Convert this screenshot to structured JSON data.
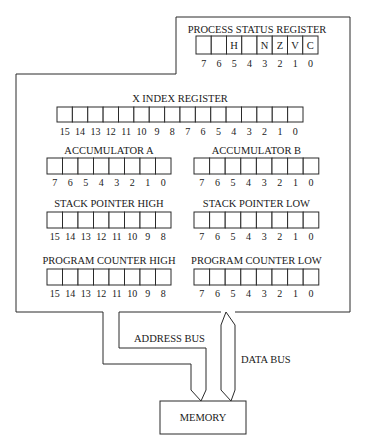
{
  "diagram": {
    "colors": {
      "line": "#2a2a2a",
      "text": "#1a1a1a",
      "background": "#ffffff"
    },
    "registers": [
      {
        "id": "psr",
        "label": "PROCESS STATUS REGISTER",
        "x": 196,
        "y": 36,
        "w": 15.25,
        "h": 18,
        "labelY": 33,
        "numY": 67,
        "bits": [
          "7",
          "6",
          "5",
          "4",
          "3",
          "2",
          "1",
          "0"
        ],
        "cells": [
          "",
          "",
          "H",
          "",
          "N",
          "Z",
          "V",
          "C"
        ]
      },
      {
        "id": "x-index",
        "label": "X INDEX REGISTER",
        "x": 57,
        "y": 107,
        "w": 15.375,
        "h": 15,
        "labelY": 102,
        "numY": 135,
        "bits": [
          "15",
          "14",
          "13",
          "12",
          "11",
          "10",
          "9",
          "8",
          "7",
          "6",
          "5",
          "4",
          "3",
          "2",
          "1",
          "0"
        ]
      },
      {
        "id": "acc-a",
        "label": "ACCUMULATOR A",
        "x": 47,
        "y": 158,
        "w": 15.5,
        "h": 16,
        "labelY": 154,
        "numY": 186,
        "bits": [
          "7",
          "6",
          "5",
          "4",
          "3",
          "2",
          "1",
          "0"
        ]
      },
      {
        "id": "acc-b",
        "label": "ACCUMULATOR B",
        "x": 194,
        "y": 158,
        "w": 15.6,
        "h": 16,
        "labelY": 154,
        "numY": 186,
        "bits": [
          "7",
          "6",
          "5",
          "4",
          "3",
          "2",
          "1",
          "0"
        ]
      },
      {
        "id": "sp-high",
        "label": "STACK POINTER HIGH",
        "x": 47,
        "y": 212,
        "w": 15.5,
        "h": 16,
        "labelY": 207,
        "numY": 240,
        "bits": [
          "15",
          "14",
          "13",
          "12",
          "11",
          "10",
          "9",
          "8"
        ]
      },
      {
        "id": "sp-low",
        "label": "STACK POINTER LOW",
        "x": 194,
        "y": 212,
        "w": 15.6,
        "h": 16,
        "labelY": 207,
        "numY": 240,
        "bits": [
          "7",
          "6",
          "5",
          "4",
          "3",
          "2",
          "1",
          "0"
        ]
      },
      {
        "id": "pc-high",
        "label": "PROGRAM COUNTER HIGH",
        "x": 47,
        "y": 269,
        "w": 15.5,
        "h": 16,
        "labelY": 264,
        "numY": 297,
        "bits": [
          "15",
          "14",
          "13",
          "12",
          "11",
          "10",
          "9",
          "8"
        ]
      },
      {
        "id": "pc-low",
        "label": "PROGRAM COUNTER LOW",
        "x": 194,
        "y": 269,
        "w": 15.6,
        "h": 16,
        "labelY": 264,
        "numY": 297,
        "bits": [
          "7",
          "6",
          "5",
          "4",
          "3",
          "2",
          "1",
          "0"
        ]
      }
    ],
    "buses": {
      "address_label": "ADDRESS BUS",
      "data_label": "DATA BUS"
    },
    "memory": {
      "label": "MEMORY"
    }
  }
}
